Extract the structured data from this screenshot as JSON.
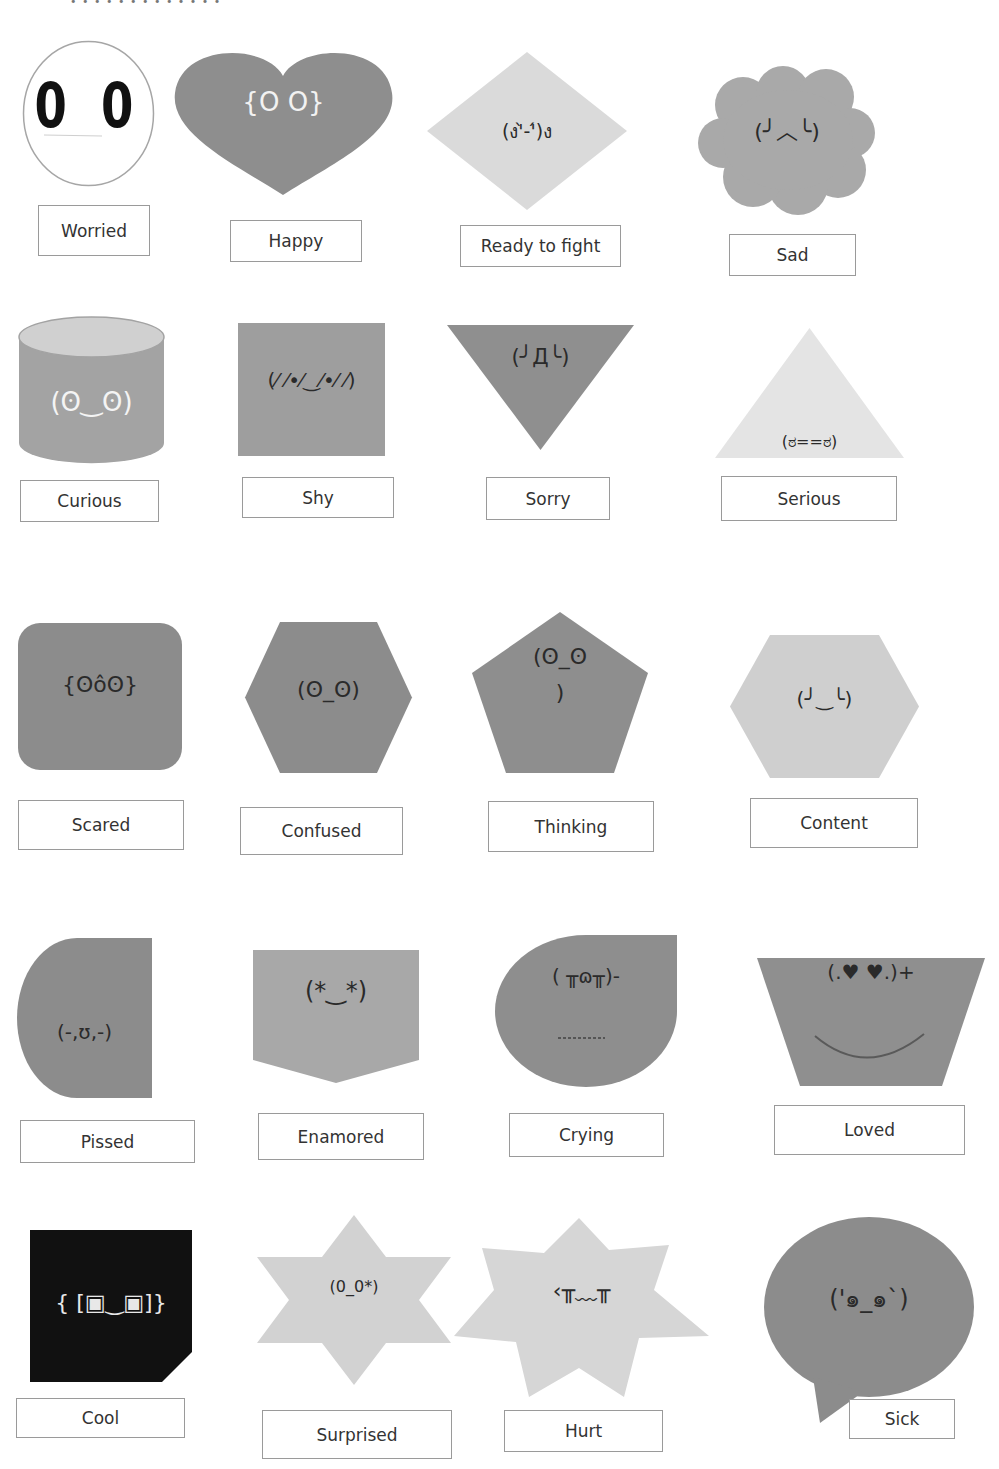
{
  "header": {
    "cut_off_text": "• • • • • • •  •  • •  • • •"
  },
  "colors": {
    "dark_gray": "#8c8c8c",
    "medium_gray": "#9a9a9a",
    "light_gray": "#d9d9d9",
    "outline_gray": "#a6a6a6",
    "black": "#0d0d0d",
    "white": "#ffffff"
  },
  "items": [
    {
      "emotion": "Worried",
      "kaomoji": "0 0",
      "shape": "circle",
      "fill": "#ffffff"
    },
    {
      "emotion": "Happy",
      "kaomoji": "{O O}",
      "shape": "heart",
      "fill": "#8e8e8e"
    },
    {
      "emotion": "Ready to fight",
      "kaomoji": "(ง'̀-'́)ง",
      "shape": "diamond",
      "fill": "#dadada"
    },
    {
      "emotion": "Sad",
      "kaomoji": "(╯︿╰)",
      "shape": "cloud",
      "fill": "#a9a9a9"
    },
    {
      "emotion": "Curious",
      "kaomoji": "(ʘ‿ʘ)",
      "shape": "cylinder",
      "fill": "#a3a3a3"
    },
    {
      "emotion": "Shy",
      "kaomoji": "(⁄ ⁄•⁄‿⁄•⁄ ⁄)",
      "shape": "square",
      "fill": "#9e9e9e"
    },
    {
      "emotion": "Sorry",
      "kaomoji": "(╯Д╰)",
      "shape": "inverted-triangle",
      "fill": "#8f8f8f"
    },
    {
      "emotion": "Serious",
      "kaomoji": "(ಠ==ಠ)",
      "shape": "triangle",
      "fill": "#e4e4e4"
    },
    {
      "emotion": "Scared",
      "kaomoji": "{ʘôʘ}",
      "shape": "rounded-square",
      "fill": "#8c8c8c"
    },
    {
      "emotion": "Confused",
      "kaomoji": "(ʘ_ʘ)",
      "shape": "hexagon",
      "fill": "#8c8c8c"
    },
    {
      "emotion": "Thinking",
      "kaomoji": "(ʘ_ʘ\n)",
      "shape": "pentagon",
      "fill": "#8e8e8e"
    },
    {
      "emotion": "Content",
      "kaomoji": "(╯‿╰)",
      "shape": "hexagon",
      "fill": "#cfcfcf"
    },
    {
      "emotion": "Pissed",
      "kaomoji": "(-,ʊ,-)",
      "shape": "half-circle",
      "fill": "#8c8c8c"
    },
    {
      "emotion": "Enamored",
      "kaomoji": "(*‿*)",
      "shape": "pentagon-pocket",
      "fill": "#a8a8a8"
    },
    {
      "emotion": "Crying",
      "kaomoji": "( ╥ɷ╥)-",
      "shape": "teardrop",
      "fill": "#8e8e8e"
    },
    {
      "emotion": "Loved",
      "kaomoji": "(.♥ ♥.)+",
      "shape": "trapezoid",
      "fill": "#8f8f8f"
    },
    {
      "emotion": "Cool",
      "kaomoji": "{ [▣‿▣]}",
      "shape": "snip-square",
      "fill": "#111111"
    },
    {
      "emotion": "Surprised",
      "kaomoji": "(0_0*)",
      "shape": "six-point-star",
      "fill": "#d2d2d2"
    },
    {
      "emotion": "Hurt",
      "kaomoji": "‹╥﹏╥",
      "shape": "seven-point-star",
      "fill": "#d6d6d6"
    },
    {
      "emotion": "Sick",
      "kaomoji": "('๑_๑`)",
      "shape": "speech-bubble",
      "fill": "#8c8c8c"
    }
  ]
}
